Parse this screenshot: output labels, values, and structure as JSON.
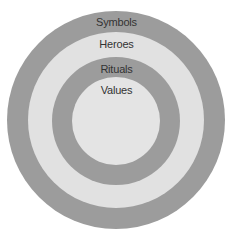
{
  "diagram": {
    "type": "concentric-circles",
    "layers": [
      {
        "label": "Symbols",
        "color": "#9c9c9c"
      },
      {
        "label": "Heroes",
        "color": "#e1e1e1"
      },
      {
        "label": "Rituals",
        "color": "#9c9c9c"
      },
      {
        "label": "Values",
        "color": "#e4e4e4"
      }
    ]
  }
}
